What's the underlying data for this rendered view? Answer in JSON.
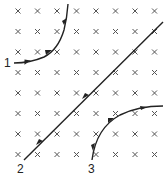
{
  "diagram": {
    "field": {
      "symbol": "×",
      "direction": "into-page",
      "grid": {
        "columns": 8,
        "rows": 8,
        "x": [
          18,
          37.5,
          57,
          76.5,
          96,
          115.5,
          135,
          154.5
        ],
        "y": [
          11,
          31.5,
          52,
          72.5,
          93,
          113.5,
          134,
          154.5
        ]
      },
      "color": "#555555"
    },
    "trajectories": [
      {
        "label": "1",
        "shape": "curve-bending-up-left",
        "start": [
          14,
          63
        ],
        "end": [
          68,
          4
        ]
      },
      {
        "label": "2",
        "shape": "straight-line",
        "start": [
          24,
          160
        ],
        "end": [
          163,
          22
        ]
      },
      {
        "label": "3",
        "shape": "curve-bending-right",
        "start": [
          92,
          160
        ],
        "end": [
          163,
          106
        ]
      }
    ],
    "labels": {
      "one": "1",
      "two": "2",
      "three": "3"
    },
    "line_color": "#222222"
  }
}
